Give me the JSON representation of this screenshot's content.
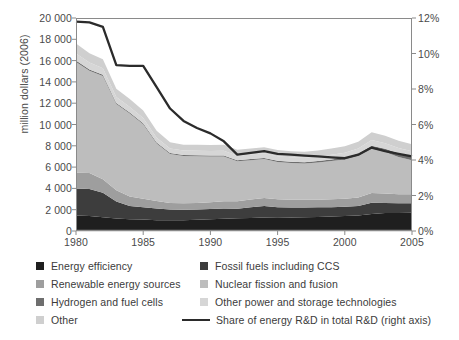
{
  "chart_data": {
    "type": "area",
    "stacked": true,
    "title": "",
    "xlabel": "",
    "ylabel": "million dollars (2006)",
    "y2label": "",
    "xlim": [
      1980,
      2005
    ],
    "ylim": [
      0,
      20000
    ],
    "y2lim": [
      0,
      12
    ],
    "grid": false,
    "legend_position": "bottom",
    "xticks": [
      "1980",
      "1985",
      "1990",
      "1995",
      "2000",
      "2005"
    ],
    "xtick_values": [
      1980,
      1985,
      1990,
      1995,
      2000,
      2005
    ],
    "yticks": [
      "0",
      "2 000",
      "4 000",
      "6 000",
      "8 000",
      "10 000",
      "12 000",
      "14 000",
      "16 000",
      "18 000",
      "20 000"
    ],
    "ytick_values": [
      0,
      2000,
      4000,
      6000,
      8000,
      10000,
      12000,
      14000,
      16000,
      18000,
      20000
    ],
    "y2ticks": [
      "0%",
      "2%",
      "4%",
      "6%",
      "8%",
      "10%",
      "12%"
    ],
    "y2tick_values": [
      0,
      2,
      4,
      6,
      8,
      10,
      12
    ],
    "x": [
      1980,
      1981,
      1982,
      1983,
      1984,
      1985,
      1986,
      1987,
      1988,
      1989,
      1990,
      1991,
      1992,
      1993,
      1994,
      1995,
      1996,
      1997,
      1998,
      1999,
      2000,
      2001,
      2002,
      2003,
      2004,
      2005
    ],
    "series": [
      {
        "name": "Energy efficiency",
        "color": "#1f1f1f",
        "values": [
          1450,
          1400,
          1280,
          1180,
          1100,
          1080,
          1020,
          1000,
          1020,
          1060,
          1100,
          1140,
          1200,
          1230,
          1260,
          1280,
          1260,
          1280,
          1320,
          1360,
          1400,
          1450,
          1600,
          1680,
          1700,
          1720
        ]
      },
      {
        "name": "Fossil fuels including CCS",
        "color": "#3d3d3d",
        "values": [
          2550,
          2550,
          2300,
          1600,
          1250,
          1150,
          1100,
          1020,
          980,
          950,
          960,
          980,
          900,
          1000,
          1080,
          950,
          940,
          920,
          900,
          880,
          870,
          900,
          1050,
          950,
          900,
          880
        ]
      },
      {
        "name": "Renewable energy sources",
        "color": "#9e9e9e",
        "values": [
          1480,
          1500,
          1280,
          1040,
          880,
          800,
          700,
          620,
          600,
          620,
          640,
          680,
          700,
          720,
          760,
          760,
          740,
          730,
          720,
          730,
          750,
          800,
          920,
          880,
          860,
          850
        ]
      },
      {
        "name": "Nuclear fission and fusion",
        "color": "#bdbdbd",
        "values": [
          10400,
          9600,
          9700,
          8100,
          7800,
          7000,
          5400,
          4600,
          4450,
          4400,
          4300,
          4200,
          3750,
          3700,
          3650,
          3500,
          3450,
          3400,
          3500,
          3600,
          3700,
          3900,
          4150,
          3900,
          3500,
          3200
        ]
      },
      {
        "name": "Hydrogen and fuel cells",
        "color": "#6e6e6e",
        "values": [
          120,
          120,
          110,
          100,
          95,
          90,
          85,
          80,
          80,
          80,
          85,
          90,
          95,
          100,
          105,
          110,
          115,
          120,
          130,
          150,
          180,
          220,
          280,
          320,
          340,
          350
        ]
      },
      {
        "name": "Other power and storage technologies",
        "color": "#d6d6d6",
        "values": [
          660,
          650,
          620,
          560,
          520,
          500,
          460,
          430,
          420,
          420,
          430,
          440,
          420,
          430,
          440,
          430,
          420,
          420,
          430,
          440,
          450,
          480,
          540,
          520,
          500,
          490
        ]
      },
      {
        "name": "Other",
        "color": "#cfcfcf",
        "values": [
          940,
          880,
          830,
          780,
          740,
          700,
          640,
          580,
          560,
          560,
          570,
          580,
          560,
          570,
          580,
          570,
          560,
          560,
          570,
          580,
          600,
          640,
          740,
          700,
          670,
          650
        ]
      }
    ],
    "stack_order": [
      "Energy efficiency",
      "Fossil fuels including CCS",
      "Renewable energy sources",
      "Nuclear fission and fusion",
      "Hydrogen and fuel cells",
      "Other power and storage technologies",
      "Other"
    ],
    "line_series": {
      "name": "Share of energy R&D in total R&D (right axis)",
      "color": "#2b2b2b",
      "axis": "right",
      "unit": "%",
      "values": [
        11.8,
        11.75,
        11.5,
        9.35,
        9.3,
        9.3,
        8.1,
        6.9,
        6.2,
        5.8,
        5.5,
        5.05,
        4.3,
        4.4,
        4.5,
        4.35,
        4.3,
        4.25,
        4.2,
        4.15,
        4.1,
        4.3,
        4.7,
        4.5,
        4.35,
        4.2
      ]
    }
  },
  "axes": {
    "ylabel": "million dollars (2006)"
  },
  "legend": {
    "items": [
      {
        "label": "Energy efficiency",
        "color": "#1f1f1f",
        "marker": "square"
      },
      {
        "label": "Renewable energy sources",
        "color": "#9e9e9e",
        "marker": "square"
      },
      {
        "label": "Hydrogen and fuel cells",
        "color": "#6e6e6e",
        "marker": "square"
      },
      {
        "label": "Other",
        "color": "#cfcfcf",
        "marker": "square"
      },
      {
        "label": "Fossil fuels including CCS",
        "color": "#3d3d3d",
        "marker": "square"
      },
      {
        "label": "Nuclear fission and fusion",
        "color": "#bdbdbd",
        "marker": "square"
      },
      {
        "label": "Other power and storage technologies",
        "color": "#d6d6d6",
        "marker": "square"
      },
      {
        "label": "Share of energy R&D in total R&D (right axis)",
        "color": "#2b2b2b",
        "marker": "line"
      }
    ]
  }
}
